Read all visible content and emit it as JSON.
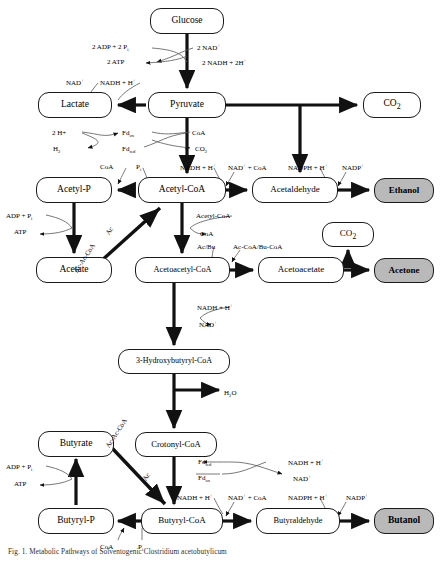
{
  "figure": {
    "caption": "Fig. 1. Metabolic Pathways of Solventogenic Clostridium acetobutylicum",
    "colors": {
      "product_fill": "#b9b9b9",
      "node_fill": "#ffffff",
      "stroke": "#1a1a1a",
      "cofactor_stroke": "#555555"
    }
  },
  "nodes": [
    {
      "id": "glucose",
      "label": "Glucose",
      "x": 150,
      "y": 8,
      "w": 74,
      "h": 26,
      "font": 9.5,
      "type": "metabolite"
    },
    {
      "id": "pyruvate",
      "label": "Pyruvate",
      "x": 148,
      "y": 92,
      "w": 78,
      "h": 26,
      "font": 9.5,
      "type": "metabolite"
    },
    {
      "id": "lactate",
      "label": "Lactate",
      "x": 38,
      "y": 92,
      "w": 74,
      "h": 26,
      "font": 9.5,
      "type": "metabolite"
    },
    {
      "id": "co2-top",
      "label": "CO2",
      "x": 363,
      "y": 92,
      "w": 58,
      "h": 26,
      "font": 9.5,
      "type": "metabolite"
    },
    {
      "id": "acetyl-p",
      "label": "Acetyl-P",
      "x": 36,
      "y": 177,
      "w": 76,
      "h": 26,
      "font": 9.5,
      "type": "metabolite"
    },
    {
      "id": "acetyl-coa",
      "label": "Acetyl-CoA",
      "x": 138,
      "y": 177,
      "w": 88,
      "h": 26,
      "font": 9.5,
      "type": "metabolite"
    },
    {
      "id": "acetaldehyde",
      "label": "Acetaldehyde",
      "x": 252,
      "y": 177,
      "w": 86,
      "h": 26,
      "font": 9,
      "type": "metabolite"
    },
    {
      "id": "ethanol",
      "label": "Ethanol",
      "x": 374,
      "y": 178,
      "w": 60,
      "h": 25,
      "font": 9,
      "type": "product"
    },
    {
      "id": "acetate",
      "label": "Acetate",
      "x": 36,
      "y": 257,
      "w": 76,
      "h": 26,
      "font": 9.5,
      "type": "metabolite"
    },
    {
      "id": "acetoacetyl-coa",
      "label": "Acetoacetyl-CoA",
      "x": 135,
      "y": 257,
      "w": 95,
      "h": 26,
      "font": 8.3,
      "type": "metabolite"
    },
    {
      "id": "acetoacetate",
      "label": "Acetoacetate",
      "x": 258,
      "y": 257,
      "w": 86,
      "h": 26,
      "font": 9,
      "type": "metabolite"
    },
    {
      "id": "acetone",
      "label": "Acetone",
      "x": 374,
      "y": 258,
      "w": 60,
      "h": 25,
      "font": 9,
      "type": "product"
    },
    {
      "id": "co2-mid",
      "label": "CO2",
      "x": 322,
      "y": 222,
      "w": 52,
      "h": 25,
      "font": 9,
      "type": "metabolite"
    },
    {
      "id": "3-hydroxybutyryl",
      "label": "3-Hydroxybutyryl-CoA",
      "x": 118,
      "y": 349,
      "w": 112,
      "h": 25,
      "font": 8,
      "type": "metabolite"
    },
    {
      "id": "crotonyl-coa",
      "label": "Crotonyl-CoA",
      "x": 135,
      "y": 432,
      "w": 82,
      "h": 25,
      "font": 8.6,
      "type": "metabolite"
    },
    {
      "id": "butyrate",
      "label": "Butyrate",
      "x": 38,
      "y": 431,
      "w": 76,
      "h": 26,
      "font": 9.5,
      "type": "metabolite"
    },
    {
      "id": "butyryl-p",
      "label": "Butyryl-P",
      "x": 38,
      "y": 508,
      "w": 76,
      "h": 26,
      "font": 9.5,
      "type": "metabolite"
    },
    {
      "id": "butyryl-coa",
      "label": "Butyryl-CoA",
      "x": 141,
      "y": 508,
      "w": 82,
      "h": 26,
      "font": 9,
      "type": "metabolite"
    },
    {
      "id": "butyraldehyde",
      "label": "Butyraldehyde",
      "x": 256,
      "y": 508,
      "w": 84,
      "h": 26,
      "font": 8.3,
      "type": "metabolite"
    },
    {
      "id": "butanol",
      "label": "Butanol",
      "x": 374,
      "y": 508,
      "w": 60,
      "h": 26,
      "font": 9.5,
      "type": "product"
    }
  ],
  "cofactors": [
    {
      "id": "glyc-adp",
      "text": "2 ADP + 2 Pi",
      "x": 92,
      "y": 43,
      "font": 7,
      "align": "left"
    },
    {
      "id": "glyc-nad",
      "text": "2 NAD+",
      "x": 197,
      "y": 43,
      "font": 7,
      "align": "left"
    },
    {
      "id": "glyc-atp",
      "text": "2 ATP",
      "x": 107,
      "y": 58,
      "font": 7,
      "align": "left"
    },
    {
      "id": "glyc-nadh",
      "text": "2 NADH + 2H+",
      "x": 202,
      "y": 58,
      "font": 7,
      "align": "left"
    },
    {
      "id": "lac-nad",
      "text": "NAD+",
      "x": 66,
      "y": 78,
      "font": 7,
      "align": "left"
    },
    {
      "id": "lac-nadh",
      "text": "NADH + H+",
      "x": 100,
      "y": 78,
      "font": 7,
      "align": "left"
    },
    {
      "id": "h2-2h",
      "text": "2 H+",
      "x": 52,
      "y": 129,
      "font": 7,
      "align": "left"
    },
    {
      "id": "fdox-top",
      "text": "Fdox",
      "x": 122,
      "y": 129,
      "font": 7,
      "align": "left"
    },
    {
      "id": "coa-pyr",
      "text": "CoA",
      "x": 192,
      "y": 129,
      "font": 7,
      "align": "left"
    },
    {
      "id": "h2-out",
      "text": "H2",
      "x": 53,
      "y": 145,
      "font": 7,
      "align": "left"
    },
    {
      "id": "fdred-top",
      "text": "Fdred",
      "x": 122,
      "y": 145,
      "font": 7,
      "align": "left"
    },
    {
      "id": "co2-pyr",
      "text": "CO2",
      "x": 195,
      "y": 145,
      "font": 7,
      "align": "left"
    },
    {
      "id": "coa-ap",
      "text": "CoA",
      "x": 100,
      "y": 163,
      "font": 7,
      "align": "left"
    },
    {
      "id": "pi-ap",
      "text": "Pi",
      "x": 136,
      "y": 163,
      "font": 7,
      "align": "left"
    },
    {
      "id": "ald-nadh",
      "text": "NADH + H+",
      "x": 180,
      "y": 163,
      "font": 7,
      "align": "left"
    },
    {
      "id": "ald-nadcoa",
      "text": "NAD+ + CoA",
      "x": 228,
      "y": 163,
      "font": 7,
      "align": "left"
    },
    {
      "id": "eth-nadph",
      "text": "NADPH + H+",
      "x": 288,
      "y": 163,
      "font": 7,
      "align": "left"
    },
    {
      "id": "eth-nadp",
      "text": "NADP+",
      "x": 342,
      "y": 163,
      "font": 7,
      "align": "left"
    },
    {
      "id": "ace-adp",
      "text": "ADP + Pi",
      "x": 6,
      "y": 212,
      "font": 7,
      "align": "left"
    },
    {
      "id": "ace-atp",
      "text": "ATP",
      "x": 14,
      "y": 228,
      "font": 7,
      "align": "left"
    },
    {
      "id": "thl-acoa",
      "text": "Acetyl-CoA",
      "x": 196,
      "y": 212,
      "font": 7,
      "align": "left"
    },
    {
      "id": "thl-coa",
      "text": "CoA",
      "x": 200,
      "y": 230,
      "font": 7,
      "align": "left"
    },
    {
      "id": "ctf-acbu",
      "text": "Ac/Bu",
      "x": 197,
      "y": 243,
      "font": 7,
      "align": "left"
    },
    {
      "id": "ctf-coa",
      "text": "Ac-CoA/Bu-CoA",
      "x": 233,
      "y": 243,
      "font": 7,
      "align": "left"
    },
    {
      "id": "hbd-nadh",
      "text": "NADH + H+",
      "x": 197,
      "y": 303,
      "font": 7,
      "align": "left"
    },
    {
      "id": "hbd-nad",
      "text": "NAD+",
      "x": 199,
      "y": 320,
      "font": 7,
      "align": "left"
    },
    {
      "id": "crt-h2o",
      "text": "H2O",
      "x": 224,
      "y": 389,
      "font": 7,
      "align": "left"
    },
    {
      "id": "bcd-fdred",
      "text": "Fdred",
      "x": 198,
      "y": 458,
      "font": 7,
      "align": "left"
    },
    {
      "id": "bcd-nadh",
      "text": "NADH + H+",
      "x": 288,
      "y": 458,
      "font": 7,
      "align": "left"
    },
    {
      "id": "bcd-fdox",
      "text": "Fdox",
      "x": 198,
      "y": 474,
      "font": 7,
      "align": "left"
    },
    {
      "id": "bcd-nad",
      "text": "NAD+",
      "x": 293,
      "y": 474,
      "font": 7,
      "align": "left"
    },
    {
      "id": "but-adp",
      "text": "ADP + Pi",
      "x": 6,
      "y": 463,
      "font": 7,
      "align": "left"
    },
    {
      "id": "but-atp",
      "text": "ATP",
      "x": 14,
      "y": 480,
      "font": 7,
      "align": "left"
    },
    {
      "id": "bald-nadh",
      "text": "NADH + H+",
      "x": 177,
      "y": 493,
      "font": 7,
      "align": "left"
    },
    {
      "id": "bald-nadcoa",
      "text": "NAD+ + CoA",
      "x": 228,
      "y": 493,
      "font": 7,
      "align": "left"
    },
    {
      "id": "bol-nadph",
      "text": "NADPH + H+",
      "x": 288,
      "y": 493,
      "font": 7,
      "align": "left"
    },
    {
      "id": "bol-nadp",
      "text": "NADP+",
      "x": 346,
      "y": 493,
      "font": 7,
      "align": "left"
    },
    {
      "id": "ptb-coa",
      "text": "CoA",
      "x": 100,
      "y": 543,
      "font": 7,
      "align": "left"
    },
    {
      "id": "ptb-pi",
      "text": "Pi",
      "x": 138,
      "y": 543,
      "font": 7,
      "align": "left"
    }
  ],
  "rotated_labels": [
    {
      "id": "aak-acaccoa",
      "text": "Ac-Ac-CoA",
      "x": 72,
      "y": 270,
      "angle": -57,
      "font": 6.8
    },
    {
      "id": "aak-ac",
      "text": "Ac",
      "x": 104,
      "y": 232,
      "angle": -57,
      "font": 6.8
    },
    {
      "id": "bak-acaccoa",
      "text": "Ac-Ac-CoA",
      "x": 104,
      "y": 445,
      "angle": -57,
      "font": 6.8
    },
    {
      "id": "bak-ac",
      "text": "Ac",
      "x": 141,
      "y": 478,
      "angle": -57,
      "font": 6.8
    }
  ]
}
